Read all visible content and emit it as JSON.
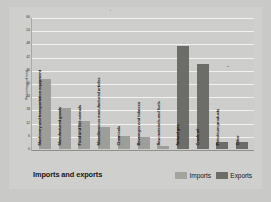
{
  "chart_data": {
    "type": "bar",
    "title": "Imports and exports",
    "xlabel": "",
    "ylabel": "Percentage of total",
    "ylim": [
      0,
      60
    ],
    "grid": true,
    "legend_position": "bottom-right",
    "yticks": [
      "60",
      "54",
      "48",
      "42",
      "36",
      "30",
      "24",
      "18",
      "12",
      "6",
      "0"
    ],
    "legend": [
      {
        "name": "Imports",
        "color": "#a3a3a0"
      },
      {
        "name": "Exports",
        "color": "#6c6c69"
      }
    ],
    "categories": [
      "Machinery and transportation equipment",
      "Manufactured goods",
      "Food and live animals",
      "Miscellaneous manufactured articles",
      "Chemicals",
      "Beverages and tobacco",
      "Raw materials and fuels",
      "Natural gas",
      "Crude oil",
      "Petroleum products",
      "Other"
    ],
    "bars": [
      {
        "label": "Machinery and transportation equipment",
        "value": 32,
        "series": "Imports"
      },
      {
        "label": "Manufactured goods",
        "value": 19,
        "series": "Imports"
      },
      {
        "label": "Food and live animals",
        "value": 13,
        "series": "Imports"
      },
      {
        "label": "Miscellaneous manufactured articles",
        "value": 10,
        "series": "Imports"
      },
      {
        "label": "Chemicals",
        "value": 6,
        "series": "Imports"
      },
      {
        "label": "Beverages and tobacco",
        "value": 5.5,
        "series": "Imports"
      },
      {
        "label": "Raw materials and fuels",
        "value": 1.5,
        "series": "Imports"
      },
      {
        "label": "Natural gas",
        "value": 47,
        "series": "Exports"
      },
      {
        "label": "Crude oil",
        "value": 39,
        "series": "Exports"
      },
      {
        "label": "Petroleum products",
        "value": 3,
        "series": "Exports"
      },
      {
        "label": "Other",
        "value": 3,
        "series": "Exports"
      }
    ],
    "series": [
      {
        "name": "Imports",
        "values": [
          32,
          19,
          13,
          10,
          6,
          5.5,
          1.5,
          null,
          null,
          null,
          null
        ]
      },
      {
        "name": "Exports",
        "values": [
          null,
          null,
          null,
          null,
          null,
          null,
          null,
          47,
          39,
          3,
          3
        ]
      }
    ]
  }
}
